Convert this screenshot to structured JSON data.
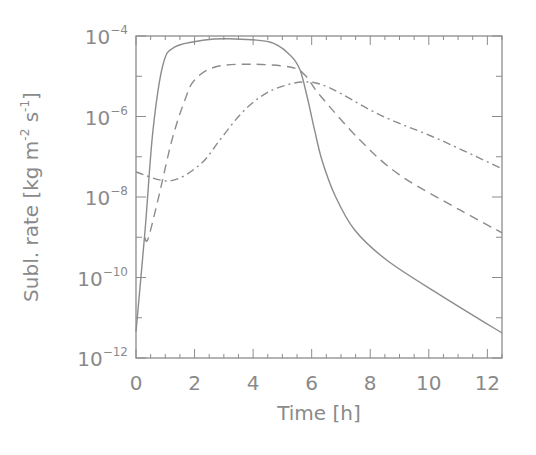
{
  "chart_data": {
    "type": "line",
    "title": "",
    "xlabel": "Time [h]",
    "ylabel": "Subl. rate [kg m⁻² s⁻¹]",
    "ylabel_parts": {
      "main": "Subl. rate [kg m",
      "sup1": "-2",
      "mid": " s",
      "sup2": "-1",
      "end": "]"
    },
    "xlim": [
      0,
      12.5
    ],
    "ylim": [
      1e-12,
      0.0001
    ],
    "yscale": "log",
    "grid": false,
    "legend": null,
    "x_ticks": [
      0,
      2,
      4,
      6,
      8,
      10,
      12
    ],
    "x_tick_labels": [
      "0",
      "2",
      "4",
      "6",
      "8",
      "10",
      "12"
    ],
    "y_ticks": [
      -4,
      -6,
      -8,
      -10,
      -12
    ],
    "y_tick_labels": [
      {
        "base": "10",
        "exp": "−4"
      },
      {
        "base": "10",
        "exp": "−6"
      },
      {
        "base": "10",
        "exp": "−8"
      },
      {
        "base": "10",
        "exp": "−10"
      },
      {
        "base": "10",
        "exp": "−12"
      }
    ],
    "series": [
      {
        "name": "solid",
        "style": "solid",
        "color": "#8c8c8c",
        "t": [
          0,
          0.31,
          0.58,
          0.92,
          1.33,
          2.35,
          3.2,
          4.57,
          5.26,
          5.6,
          5.87,
          6.1,
          6.35,
          6.79,
          7.47,
          8.57,
          10.38,
          12.5
        ],
        "log10_value": [
          -11.35,
          -8.82,
          -6.34,
          -4.72,
          -4.27,
          -4.1,
          -4.07,
          -4.15,
          -4.47,
          -4.84,
          -5.59,
          -6.34,
          -7.08,
          -7.95,
          -8.82,
          -9.57,
          -10.43,
          -11.38
        ]
      },
      {
        "name": "dashed",
        "style": "dashed",
        "color": "#8c8c8c",
        "t": [
          0.3,
          0.41,
          0.75,
          1.23,
          1.67,
          2.0,
          2.7,
          3.9,
          5.26,
          5.77,
          6.28,
          7.64,
          9.0,
          11.06,
          12.5
        ],
        "log10_value": [
          -9.0,
          -9.04,
          -8.07,
          -6.58,
          -5.59,
          -5.09,
          -4.77,
          -4.7,
          -4.77,
          -4.97,
          -5.47,
          -6.58,
          -7.45,
          -8.32,
          -8.89
        ]
      },
      {
        "name": "dash-dot",
        "style": "dashdot",
        "color": "#8c8c8c",
        "t": [
          0,
          1.16,
          2.18,
          2.87,
          3.55,
          4.23,
          4.91,
          5.77,
          6.62,
          8.33,
          10.38,
          12.5
        ],
        "log10_value": [
          -7.38,
          -7.6,
          -7.2,
          -6.58,
          -5.96,
          -5.52,
          -5.27,
          -5.14,
          -5.29,
          -5.96,
          -6.58,
          -7.3
        ]
      }
    ]
  },
  "colors": {
    "axis": "#8c8c8c",
    "text": "#8a8a8a",
    "background": "#ffffff"
  }
}
